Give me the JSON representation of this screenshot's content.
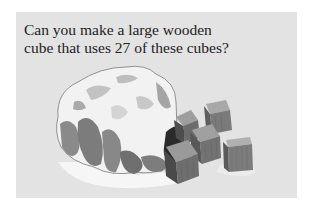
{
  "panel": {
    "background": "#e3e3e3",
    "question_lines": [
      "Can you make a large wooden",
      "cube that uses 27 of these cubes?"
    ]
  },
  "illustration": {
    "subject": "cloth bag spilling small wooden cubes",
    "visible_cube_count": 6,
    "colors": {
      "bag_light": "#f4f4f4",
      "bag_mid": "#b5b5b5",
      "bag_dark": "#707070",
      "cube_top": "#9a9a9a",
      "cube_front": "#6e6e6e",
      "cube_side": "#555555",
      "shadow": "#f7f7f7"
    }
  }
}
